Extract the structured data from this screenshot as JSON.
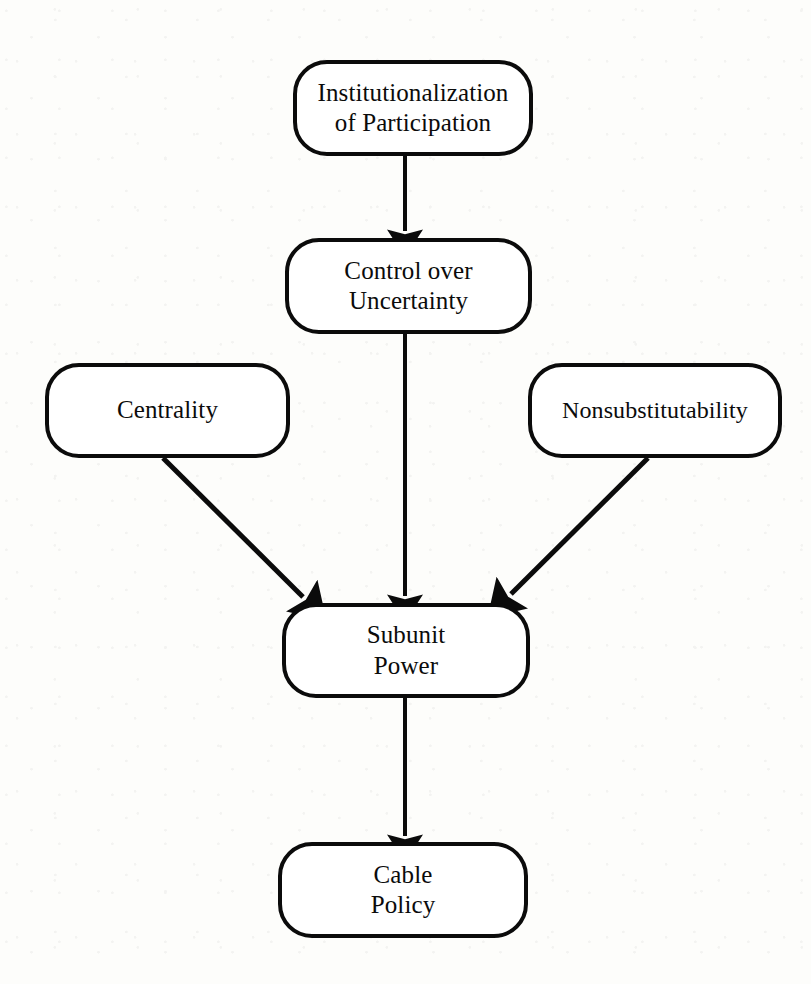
{
  "diagram": {
    "background_color": "#fdfdfb",
    "stroke_color": "#0b0b0b",
    "text_color": "#0b0b0b",
    "nodes": [
      {
        "id": "institutionalization",
        "label": "Institutionalization\nof Participation",
        "shape": "rounded-rectangle"
      },
      {
        "id": "control-uncertainty",
        "label": "Control over\nUncertainty",
        "shape": "rounded-rectangle"
      },
      {
        "id": "centrality",
        "label": "Centrality",
        "shape": "rounded-rectangle"
      },
      {
        "id": "nonsubstitutability",
        "label": "Nonsubstitutability",
        "shape": "rounded-rectangle"
      },
      {
        "id": "subunit-power",
        "label": "Subunit\nPower",
        "shape": "rounded-rectangle"
      },
      {
        "id": "cable-policy",
        "label": "Cable\nPolicy",
        "shape": "rounded-rectangle"
      }
    ],
    "edges": [
      {
        "id": "edge-inst-to-control",
        "from": "institutionalization",
        "to": "control-uncertainty",
        "style": "solid-arrow",
        "direction": "down"
      },
      {
        "id": "edge-control-to-power",
        "from": "control-uncertainty",
        "to": "subunit-power",
        "style": "solid-arrow",
        "direction": "down"
      },
      {
        "id": "edge-centrality-to-power",
        "from": "centrality",
        "to": "subunit-power",
        "style": "solid-arrow",
        "direction": "down-right"
      },
      {
        "id": "edge-nonsub-to-power",
        "from": "nonsubstitutability",
        "to": "subunit-power",
        "style": "solid-arrow",
        "direction": "down-left"
      },
      {
        "id": "edge-power-to-cable",
        "from": "subunit-power",
        "to": "cable-policy",
        "style": "solid-arrow",
        "direction": "down"
      }
    ]
  }
}
